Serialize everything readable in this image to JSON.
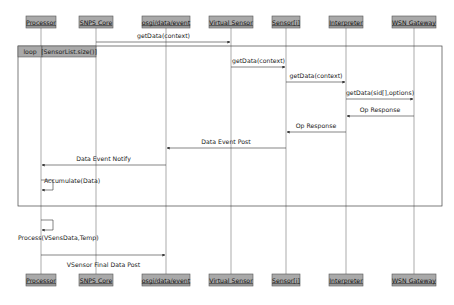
{
  "diagram": {
    "type": "sequence",
    "participants": [
      {
        "id": "processor",
        "label": "Processor"
      },
      {
        "id": "snps",
        "label": "SNPS Core"
      },
      {
        "id": "osgi",
        "label": "osgi/data/event"
      },
      {
        "id": "vsensor",
        "label": "Virtual Sensor"
      },
      {
        "id": "sensor",
        "label": "Sensor[i]"
      },
      {
        "id": "interp",
        "label": "Interpreter"
      },
      {
        "id": "wsn",
        "label": "WSN Gateway"
      }
    ],
    "loop": {
      "keyword": "loop",
      "guard": "[SensorList.size()]"
    },
    "messages": [
      {
        "from": "snps",
        "to": "vsensor",
        "label": "getData(context)",
        "kind": "sync"
      },
      {
        "from": "vsensor",
        "to": "sensor",
        "label": "getData(context)",
        "kind": "sync"
      },
      {
        "from": "sensor",
        "to": "interp",
        "label": "getData(context)",
        "kind": "sync"
      },
      {
        "from": "interp",
        "to": "wsn",
        "label": "getData(sid[],options)",
        "kind": "sync"
      },
      {
        "from": "wsn",
        "to": "interp",
        "label": "Op Response",
        "kind": "return"
      },
      {
        "from": "interp",
        "to": "sensor",
        "label": "Op Response",
        "kind": "return"
      },
      {
        "from": "sensor",
        "to": "osgi",
        "label": "Data Event Post",
        "kind": "return"
      },
      {
        "from": "osgi",
        "to": "processor",
        "label": "Data Event Notify",
        "kind": "return"
      },
      {
        "from": "processor",
        "to": "processor",
        "label": "Accumulate(Data)",
        "kind": "self"
      },
      {
        "from": "processor",
        "to": "processor",
        "label": "Process(VSensData,Temp)",
        "kind": "self"
      },
      {
        "from": "processor",
        "to": "osgi",
        "label": "VSensor Final Data Post",
        "kind": "sync"
      }
    ]
  }
}
